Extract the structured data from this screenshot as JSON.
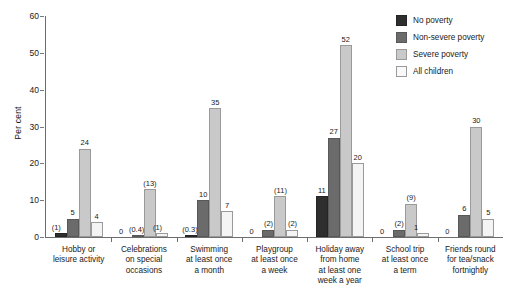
{
  "chart_data": {
    "type": "bar",
    "title": "",
    "xlabel": "",
    "ylabel": "Per cent",
    "ylim": [
      0,
      60
    ],
    "yticks": [
      "0",
      "10",
      "20",
      "30",
      "40",
      "50",
      "60"
    ],
    "grid": false,
    "legend_position": "top-right",
    "categories": [
      "Hobby or leisure activity",
      "Celebrations on special occasions",
      "Swimming at least once a month",
      "Playgroup at least once a week",
      "Holiday away from home at least one week a year",
      "School trip at least once a term",
      "Friends round for tea/snack fortnightly"
    ],
    "category_lines": [
      [
        "Hobby or",
        "leisure activity"
      ],
      [
        "Celebrations",
        "on special",
        "occasions"
      ],
      [
        "Swimming",
        "at least once",
        "a month"
      ],
      [
        "Playgroup",
        "at least once",
        "a week"
      ],
      [
        "Holiday away",
        "from home",
        "at least one",
        "week a year"
      ],
      [
        "School trip",
        "at least once",
        "a term"
      ],
      [
        "Friends round",
        "for tea/snack",
        "fortnightly"
      ]
    ],
    "series": [
      {
        "name": "No poverty",
        "color": "#2e2e2e",
        "values": [
          1,
          0,
          0.3,
          0,
          11,
          0,
          0
        ],
        "labels": [
          "(1)",
          "0",
          "(0.3)",
          "0",
          "11",
          "0",
          "0"
        ]
      },
      {
        "name": "Non-severe poverty",
        "color": "#6b6b6b",
        "values": [
          5,
          0.4,
          10,
          2,
          27,
          2,
          6
        ],
        "labels": [
          "5",
          "(0.4)",
          "10",
          "(2)",
          "27",
          "(2)",
          "6"
        ]
      },
      {
        "name": "Severe poverty",
        "color": "#c9c9c9",
        "values": [
          24,
          13,
          35,
          11,
          52,
          9,
          30
        ],
        "labels": [
          "24",
          "(13)",
          "35",
          "(11)",
          "52",
          "(9)",
          "30"
        ]
      },
      {
        "name": "All children",
        "color": "#f4f4f4",
        "values": [
          4,
          1,
          7,
          2,
          20,
          1,
          5
        ],
        "labels": [
          "4",
          "(1)",
          "7",
          "(2)",
          "20",
          "1",
          "5"
        ]
      }
    ]
  }
}
